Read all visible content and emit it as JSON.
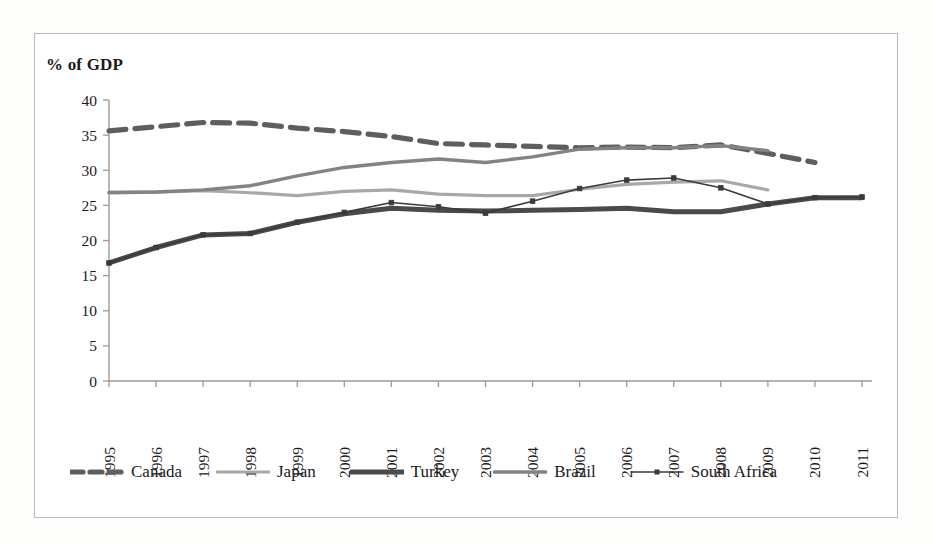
{
  "figure": {
    "axis_title": "% of GDP"
  },
  "chart_data": {
    "type": "line",
    "title": "% of GDP",
    "xlabel": "",
    "ylabel": "% of GDP",
    "ylim": [
      0,
      40
    ],
    "ytick_step": 5,
    "grid": false,
    "legend_position": "bottom",
    "yticks": [
      "0",
      "5",
      "10",
      "15",
      "20",
      "25",
      "30",
      "35",
      "40"
    ],
    "categories": [
      1995,
      1996,
      1997,
      1998,
      1999,
      2000,
      2001,
      2002,
      2003,
      2004,
      2005,
      2006,
      2007,
      2008,
      2009,
      2010,
      2011
    ],
    "xtick_labels": [
      "1995",
      "1996",
      "1997",
      "1998",
      "1999",
      "2000",
      "2001",
      "2002",
      "2003",
      "2004",
      "2005",
      "2006",
      "2007",
      "2008",
      "2009",
      "2010",
      "2011"
    ],
    "series": [
      {
        "name": "Canada",
        "color": "#5e5e5e",
        "style": "dashed",
        "width": 5.2,
        "values": [
          35.6,
          36.2,
          36.8,
          36.7,
          36.0,
          35.5,
          34.8,
          33.8,
          33.6,
          33.4,
          33.2,
          33.3,
          33.2,
          33.6,
          32.4,
          31.1,
          null
        ]
      },
      {
        "name": "Japan",
        "color": "#a8a8a8",
        "style": "solid",
        "width": 3.2,
        "values": [
          26.9,
          26.9,
          27.1,
          26.8,
          26.4,
          27.0,
          27.2,
          26.6,
          26.4,
          26.4,
          27.3,
          28.0,
          28.3,
          28.5,
          27.2,
          null,
          null
        ]
      },
      {
        "name": "Turkey",
        "color": "#4a4a4a",
        "style": "solid",
        "width": 5.0,
        "values": [
          16.8,
          19.0,
          20.8,
          21.0,
          22.6,
          23.8,
          24.6,
          24.3,
          24.2,
          24.3,
          24.4,
          24.6,
          24.1,
          24.1,
          25.2,
          26.1,
          26.1
        ]
      },
      {
        "name": "Brazil",
        "color": "#838383",
        "style": "solid",
        "width": 3.4,
        "values": [
          26.8,
          26.9,
          27.2,
          27.8,
          29.2,
          30.4,
          31.1,
          31.6,
          31.1,
          31.9,
          33.0,
          33.2,
          33.2,
          33.5,
          32.8,
          null,
          null
        ]
      },
      {
        "name": "South Africa",
        "color": "#3b3b3b",
        "style": "solid-markers",
        "width": 1.6,
        "values": [
          16.8,
          19.0,
          20.8,
          21.0,
          22.6,
          24.0,
          25.4,
          24.8,
          23.9,
          25.6,
          27.4,
          28.6,
          28.9,
          27.5,
          25.2,
          26.1,
          26.2
        ]
      }
    ]
  },
  "legend": {
    "items": [
      {
        "label": "Canada",
        "swatch": "dashed-thick-swatch"
      },
      {
        "label": "Japan",
        "swatch": "solid-light-swatch"
      },
      {
        "label": "Turkey",
        "swatch": "solid-dark-thick-swatch"
      },
      {
        "label": "Brazil",
        "swatch": "solid-medium-swatch"
      },
      {
        "label": "South Africa",
        "swatch": "solid-marker-swatch"
      }
    ]
  }
}
